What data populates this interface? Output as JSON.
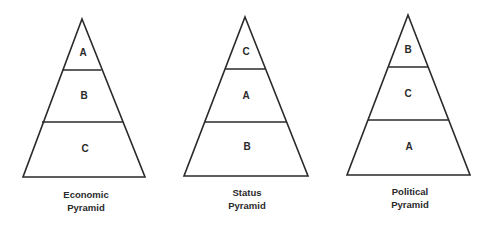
{
  "diagram": {
    "type": "comparison-pyramids",
    "stroke_color": "#2a2a2a",
    "background": "#ffffff",
    "pyramids": [
      {
        "title_line1": "Economic",
        "title_line2": "Pyramid",
        "layers": [
          {
            "position": "top",
            "label": "A"
          },
          {
            "position": "middle",
            "label": "B"
          },
          {
            "position": "bottom",
            "label": "C"
          }
        ]
      },
      {
        "title_line1": "Status",
        "title_line2": "Pyramid",
        "layers": [
          {
            "position": "top",
            "label": "C"
          },
          {
            "position": "middle",
            "label": "A"
          },
          {
            "position": "bottom",
            "label": "B"
          }
        ]
      },
      {
        "title_line1": "Political",
        "title_line2": "Pyramid",
        "layers": [
          {
            "position": "top",
            "label": "B"
          },
          {
            "position": "middle",
            "label": "C"
          },
          {
            "position": "bottom",
            "label": "A"
          }
        ]
      }
    ]
  }
}
